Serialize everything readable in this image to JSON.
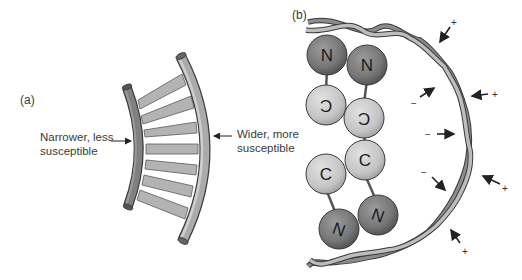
{
  "panel_a": {
    "label": "(a)",
    "left_annotation": {
      "line1": "Narrower, less",
      "line2": "susceptible"
    },
    "right_annotation": {
      "line1": "Wider, more",
      "line2": "susceptible"
    },
    "rung_count": 7
  },
  "panel_b": {
    "label": "(b)",
    "atoms": [
      {
        "symbol": "N",
        "cx": 327,
        "cy": 55,
        "type": "N",
        "rotate": 0
      },
      {
        "symbol": "N",
        "cx": 367,
        "cy": 65,
        "type": "N",
        "rotate": 0
      },
      {
        "symbol": "C",
        "cx": 326,
        "cy": 105,
        "type": "C",
        "rotate": 180
      },
      {
        "symbol": "C",
        "cx": 364,
        "cy": 118,
        "type": "C",
        "rotate": 180
      },
      {
        "symbol": "C",
        "cx": 365,
        "cy": 160,
        "type": "C",
        "rotate": 0
      },
      {
        "symbol": "C",
        "cx": 326,
        "cy": 174,
        "type": "C",
        "rotate": 0
      },
      {
        "symbol": "N",
        "cx": 378,
        "cy": 215,
        "type": "N",
        "rotate": 200
      },
      {
        "symbol": "N",
        "cx": 339,
        "cy": 229,
        "type": "N",
        "rotate": 200
      }
    ],
    "force_arrows": [
      {
        "sign": "+",
        "side": "outer"
      },
      {
        "sign": "−",
        "side": "inner"
      },
      {
        "sign": "+",
        "side": "outer"
      },
      {
        "sign": "−",
        "side": "inner"
      },
      {
        "sign": "−",
        "side": "inner"
      },
      {
        "sign": "+",
        "side": "outer"
      },
      {
        "sign": "+",
        "side": "outer"
      }
    ]
  },
  "colors": {
    "nitrogen": "#7a7a7a",
    "carbon": "#c8c8c8",
    "inner_tube": "#7d7d7d",
    "outer_tube": "#a9a9a9",
    "rung": "#b3b3b3",
    "helix_dark": "#5a5a5a",
    "helix_light": "#9a9a9a"
  }
}
